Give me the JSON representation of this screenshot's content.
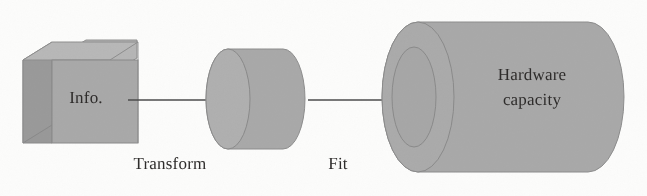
{
  "diagram": {
    "background_color": "#fcfcfb",
    "text_color": "#2e2c2b",
    "shape_fill": "#a9a9a9",
    "shape_fill_light": "#b4b4b4",
    "shape_fill_dark": "#9a9a9a",
    "shape_stroke": "#8a8a8a",
    "arrow_color": "#4a4a4a"
  },
  "nodes": [
    {
      "id": "info-cube",
      "shape": "cube",
      "label": "Info.",
      "fill": "#a9a9a9",
      "top_face_fill": "#b4b4b4",
      "side_face_fill": "#959595"
    },
    {
      "id": "transform-cylinder",
      "shape": "cylinder",
      "label": "",
      "fill": "#a9a9a9",
      "cap_fill": "#b0b0b0"
    },
    {
      "id": "hardware-cylinder",
      "shape": "tube-cylinder",
      "label_line_1": "Hardware",
      "label_line_2": "capacity",
      "fill": "#a9a9a9",
      "cap_fill": "#aeaeae"
    }
  ],
  "edges": [
    {
      "id": "edge-transform",
      "label": "Transform",
      "from": "info-cube",
      "to": "transform-cylinder",
      "color": "#4a4a4a"
    },
    {
      "id": "edge-fit",
      "label": "Fit",
      "from": "transform-cylinder",
      "to": "hardware-cylinder",
      "color": "#4a4a4a"
    }
  ]
}
